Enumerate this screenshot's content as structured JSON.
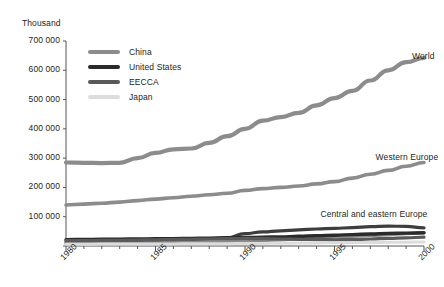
{
  "chart_data": {
    "type": "line",
    "title": "",
    "xlabel": "",
    "ylabel": "Thousand",
    "unit_label": "Thousand",
    "xlim": [
      1980,
      2000
    ],
    "ylim": [
      0,
      700000
    ],
    "grid": false,
    "legend_position": "upper-left-inside",
    "x": [
      1980,
      1981,
      1982,
      1983,
      1984,
      1985,
      1986,
      1987,
      1988,
      1989,
      1990,
      1991,
      1992,
      1993,
      1994,
      1995,
      1996,
      1997,
      1998,
      1999,
      2000
    ],
    "ytick_labels": [
      "0",
      "100 000",
      "200 000",
      "300 000",
      "400 000",
      "500 000",
      "600 000",
      "700 000"
    ],
    "ytick_values": [
      0,
      100000,
      200000,
      300000,
      400000,
      500000,
      600000,
      700000
    ],
    "xtick_labels": [
      "1980",
      "1985",
      "1990",
      "1995",
      "2000"
    ],
    "xtick_values": [
      1980,
      1985,
      1990,
      1995,
      2000
    ],
    "legend": [
      {
        "name": "China",
        "color": "#8c8c8c"
      },
      {
        "name": "United States",
        "color": "#2b2b2b"
      },
      {
        "name": "EECCA",
        "color": "#5a5a5a"
      },
      {
        "name": "Japan",
        "color": "#dcdcdc"
      }
    ],
    "annotations": [
      {
        "text": "World",
        "x": 2000,
        "y": 645000
      },
      {
        "text": "Western Europe",
        "x": 2000,
        "y": 300000
      },
      {
        "text": "Central and eastern Europe",
        "x": 1998,
        "y": 105000
      }
    ],
    "series": [
      {
        "name": "World",
        "color": "#8c8c8c",
        "width": 4.2,
        "values": [
          285000,
          284000,
          283000,
          284000,
          300000,
          318000,
          330000,
          333000,
          352000,
          375000,
          400000,
          428000,
          440000,
          455000,
          480000,
          505000,
          530000,
          565000,
          600000,
          628000,
          642000
        ]
      },
      {
        "name": "Western Europe",
        "color": "#8c8c8c",
        "width": 3.6,
        "values": [
          140000,
          143000,
          146000,
          150000,
          155000,
          160000,
          165000,
          170000,
          175000,
          180000,
          190000,
          196000,
          200000,
          205000,
          212000,
          220000,
          232000,
          245000,
          258000,
          272000,
          285000
        ]
      },
      {
        "name": "Central and eastern Europe",
        "color": "#3d3d3d",
        "width": 3.2,
        "values": [
          14000,
          15000,
          16000,
          17000,
          18000,
          19000,
          21000,
          23000,
          25000,
          28000,
          42000,
          48000,
          52000,
          55000,
          58000,
          60000,
          63000,
          66000,
          68000,
          67000,
          62000
        ]
      },
      {
        "name": "China",
        "color": "#8c8c8c",
        "width": 3.2,
        "values": [
          8000,
          8500,
          9000,
          9500,
          10000,
          11000,
          12000,
          13000,
          14000,
          15000,
          17000,
          19000,
          21000,
          24000,
          27000,
          30000,
          33000,
          36000,
          39000,
          42000,
          45000
        ]
      },
      {
        "name": "United States",
        "color": "#2b2b2b",
        "width": 3.4,
        "values": [
          22000,
          22500,
          23000,
          23500,
          24000,
          24500,
          25000,
          26000,
          27000,
          28000,
          29000,
          30000,
          31000,
          33000,
          35000,
          37000,
          39000,
          41000,
          43000,
          44000,
          45000
        ]
      },
      {
        "name": "EECCA",
        "color": "#5a5a5a",
        "width": 3.2,
        "values": [
          18000,
          18500,
          19000,
          19500,
          20000,
          21000,
          22000,
          23000,
          24000,
          25000,
          26000,
          25000,
          24000,
          23000,
          22000,
          21000,
          22000,
          24000,
          26000,
          28000,
          30000
        ]
      },
      {
        "name": "Japan",
        "color": "#dcdcdc",
        "width": 3.0,
        "values": [
          6000,
          6200,
          6400,
          6600,
          6800,
          7000,
          7200,
          7500,
          7800,
          8000,
          8500,
          9000,
          9500,
          10000,
          10500,
          11000,
          11500,
          12000,
          12500,
          13000,
          13500
        ]
      }
    ]
  },
  "axis": {
    "unit": "Thousand"
  }
}
